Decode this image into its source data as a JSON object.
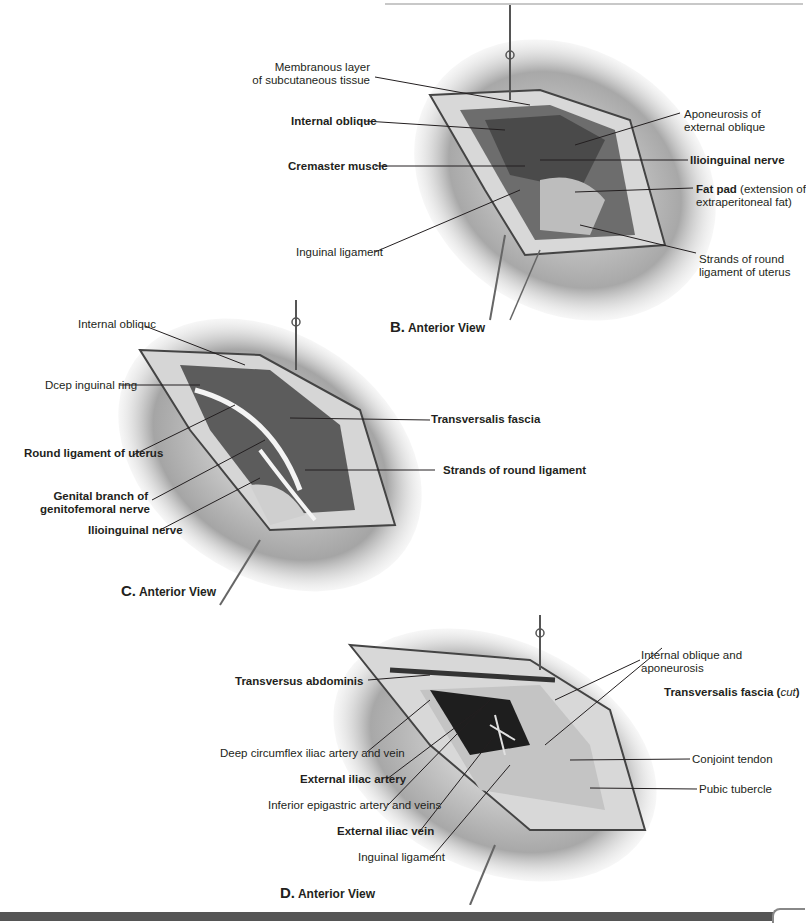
{
  "figures": {
    "B": {
      "caption_letter": "B.",
      "caption_text": "Anterior View",
      "labels": {
        "membranous_1": "Membranous layer",
        "membranous_2": "of subcutaneous tissue",
        "internal_oblique": "Internal oblique",
        "cremaster": "Cremaster muscle",
        "inguinal_ligament": "Inguinal ligament",
        "aponeurosis_1": "Aponeurosis of",
        "aponeurosis_2": "external oblique",
        "ilioinguinal": "Ilioinguinal nerve",
        "fat_pad_bold": "Fat pad",
        "fat_pad_rest": " (extension of",
        "fat_pad_2": "extraperitoneal fat)",
        "strands_1": "Strands of round",
        "strands_2": "ligament of uterus"
      }
    },
    "C": {
      "caption_letter": "C.",
      "caption_text": "Anterior View",
      "labels": {
        "internal_oblique": "Internal obliquc",
        "deep_ring": "Dcep inguinal ring",
        "round_ligament": "Round ligament of uterus",
        "genital_1": "Genital branch of",
        "genital_2": "genitofemoral nerve",
        "ilioinguinal": "Ilioinguinal nerve",
        "transversalis": "Transversalis fascia",
        "strands": "Strands of round ligament"
      }
    },
    "D": {
      "caption_letter": "D.",
      "caption_text": "Anterior View",
      "labels": {
        "transversus": "Transversus abdominis",
        "deep_circumflex": "Deep circumflex iliac artery and vein",
        "ext_iliac_artery": "External iliac artery",
        "inf_epigastric": "Inferior epigastric artery and veins",
        "ext_iliac_vein": "External iliac vein",
        "inguinal_ligament": "Inguinal ligament",
        "int_oblique_1": "Internal oblique and",
        "int_oblique_2": "aponeurosis",
        "transversalis_bold": "Transversalis fascia",
        "transversalis_cut": "cut",
        "conjoint": "Conjoint tendon",
        "pubic": "Pubic tubercle"
      }
    }
  },
  "colors": {
    "text": "#231f20",
    "skin": "#9a9a9a",
    "wound": "#5a5a5a",
    "fat": "#d9d9d9"
  }
}
